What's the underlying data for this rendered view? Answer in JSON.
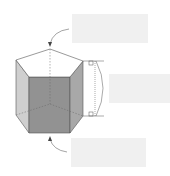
{
  "diagram": {
    "labels": {
      "top": "",
      "height": "",
      "bottom": ""
    },
    "colors": {
      "front_face": "#8f8f8f",
      "side_face": "#c8c8c8",
      "top_face": "#ffffff",
      "stroke": "#555555",
      "label_box": "#f0f0f0"
    }
  }
}
